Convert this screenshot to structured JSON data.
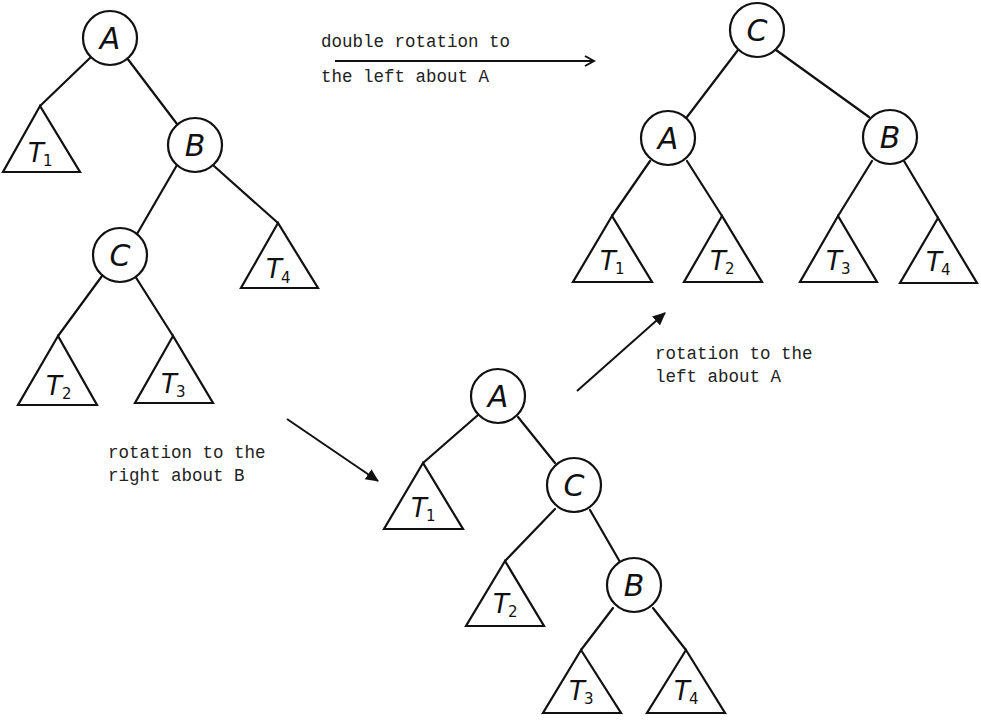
{
  "figure": {
    "trees": [
      {
        "id": "initial",
        "nodes": [
          "A",
          "B",
          "C"
        ],
        "edges": [
          [
            "A",
            "T1"
          ],
          [
            "A",
            "B"
          ],
          [
            "B",
            "C"
          ],
          [
            "B",
            "T4"
          ],
          [
            "C",
            "T2"
          ],
          [
            "C",
            "T3"
          ]
        ],
        "subtrees": [
          {
            "name": "T",
            "sub": "1"
          },
          {
            "name": "T",
            "sub": "4"
          },
          {
            "name": "T",
            "sub": "2"
          },
          {
            "name": "T",
            "sub": "3"
          }
        ]
      },
      {
        "id": "intermediate",
        "nodes": [
          "A",
          "C",
          "B"
        ],
        "edges": [
          [
            "A",
            "T1"
          ],
          [
            "A",
            "C"
          ],
          [
            "C",
            "T2"
          ],
          [
            "C",
            "B"
          ],
          [
            "B",
            "T3"
          ],
          [
            "B",
            "T4"
          ]
        ],
        "subtrees": [
          {
            "name": "T",
            "sub": "1"
          },
          {
            "name": "T",
            "sub": "2"
          },
          {
            "name": "T",
            "sub": "3"
          },
          {
            "name": "T",
            "sub": "4"
          }
        ]
      },
      {
        "id": "final",
        "nodes": [
          "C",
          "A",
          "B"
        ],
        "edges": [
          [
            "C",
            "A"
          ],
          [
            "C",
            "B"
          ],
          [
            "A",
            "T1"
          ],
          [
            "A",
            "T2"
          ],
          [
            "B",
            "T3"
          ],
          [
            "B",
            "T4"
          ]
        ],
        "subtrees": [
          {
            "name": "T",
            "sub": "1"
          },
          {
            "name": "T",
            "sub": "2"
          },
          {
            "name": "T",
            "sub": "3"
          },
          {
            "name": "T",
            "sub": "4"
          }
        ]
      }
    ],
    "captions": {
      "double_rotation": [
        "double rotation to",
        "the left about A"
      ],
      "rotation_right": [
        "rotation to the",
        "right about B"
      ],
      "rotation_left": [
        "rotation to the",
        "left about A"
      ]
    }
  }
}
